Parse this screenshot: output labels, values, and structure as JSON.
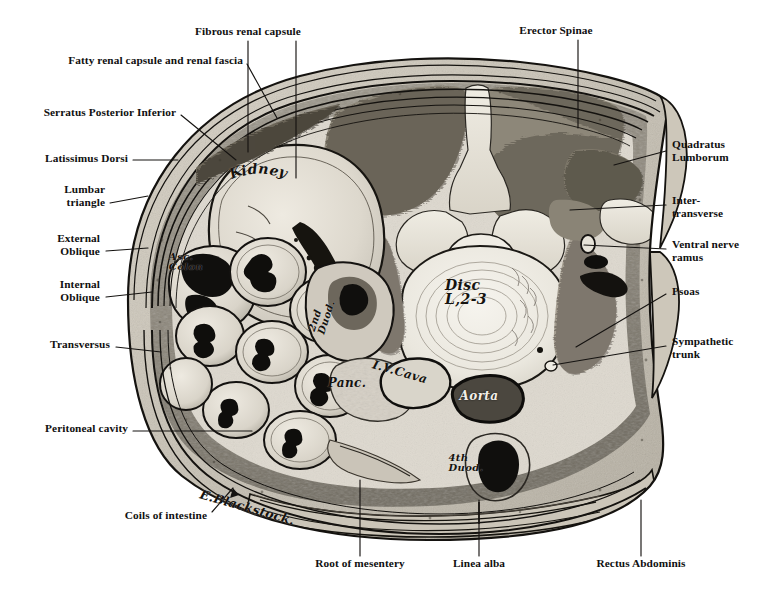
{
  "figure": {
    "kind": "anatomical-illustration",
    "signature": "E.Blackstock.",
    "palette": {
      "page_background": "#ffffff",
      "ink": "#101010",
      "leader_line": "#1a1a1a",
      "skin_fat": "#cfc9bd",
      "muscle_mid": "#9b958a",
      "muscle_dark": "#6f6a60",
      "viscera_light": "#ded9cf",
      "lumen_dark": "#141312",
      "bone_light": "#e8e4da",
      "disc_pale": "#efece4",
      "aorta_fill": "#4a463f",
      "cava_fill": "#d8d4ca"
    }
  },
  "printed_labels": [
    {
      "id": "fibrous-renal-capsule",
      "text": "Fibrous renal capsule",
      "side": "top",
      "align": "center",
      "x": 248,
      "y": 31
    },
    {
      "id": "erector-spinae",
      "text": "Erector Spinae",
      "side": "top",
      "align": "center",
      "x": 556,
      "y": 30
    },
    {
      "id": "fatty-renal-capsule",
      "text": "Fatty renal capsule and renal fascia",
      "side": "top",
      "align": "right",
      "x": 243,
      "y": 60
    },
    {
      "id": "serratus-post-inf",
      "text": "Serratus Posterior Inferior",
      "side": "left",
      "align": "right",
      "x": 176,
      "y": 112
    },
    {
      "id": "latissimus-dorsi",
      "text": "Latissimus Dorsi",
      "side": "left",
      "align": "right",
      "x": 128,
      "y": 158
    },
    {
      "id": "lumbar-triangle",
      "text": "Lumbar\ntriangle",
      "side": "left",
      "align": "right",
      "x": 105,
      "y": 189
    },
    {
      "id": "external-oblique",
      "text": "External\nOblique",
      "side": "left",
      "align": "right",
      "x": 100,
      "y": 238
    },
    {
      "id": "internal-oblique",
      "text": "Internal\nOblique",
      "side": "left",
      "align": "right",
      "x": 100,
      "y": 284
    },
    {
      "id": "transversus",
      "text": "Transversus",
      "side": "left",
      "align": "right",
      "x": 110,
      "y": 344
    },
    {
      "id": "peritoneal-cavity",
      "text": "Peritoneal cavity",
      "side": "left",
      "align": "right",
      "x": 128,
      "y": 428
    },
    {
      "id": "coils-of-intestine",
      "text": "Coils of intestine",
      "side": "left",
      "align": "right",
      "x": 207,
      "y": 515
    },
    {
      "id": "quadratus-lumborum",
      "text": "Quadratus\nLumborum",
      "side": "right",
      "align": "left",
      "x": 672,
      "y": 144
    },
    {
      "id": "inter-transverse",
      "text": "Inter-\ntransverse",
      "side": "right",
      "align": "left",
      "x": 672,
      "y": 200
    },
    {
      "id": "ventral-nerve-ramus",
      "text": "Ventral nerve\nramus",
      "side": "right",
      "align": "left",
      "x": 672,
      "y": 244
    },
    {
      "id": "psoas",
      "text": "Psoas",
      "side": "right",
      "align": "left",
      "x": 672,
      "y": 291
    },
    {
      "id": "sympathetic-trunk",
      "text": "Sympathetic\ntrunk",
      "side": "right",
      "align": "left",
      "x": 672,
      "y": 341
    },
    {
      "id": "root-of-mesentery",
      "text": "Root of mesentery",
      "side": "bottom",
      "align": "center",
      "x": 360,
      "y": 563
    },
    {
      "id": "linea-alba",
      "text": "Linea alba",
      "side": "bottom",
      "align": "center",
      "x": 479,
      "y": 563
    },
    {
      "id": "rectus-abdominis",
      "text": "Rectus Abdominis",
      "side": "bottom",
      "align": "center",
      "x": 641,
      "y": 563
    }
  ],
  "handwritten_labels": [
    {
      "id": "kidney",
      "text": "Kidney",
      "x": 258,
      "y": 168,
      "size": "lg",
      "arc": true,
      "on_dark": false
    },
    {
      "id": "asc-colon",
      "text": "Asc.\nColon",
      "x": 186,
      "y": 262,
      "size": "sm",
      "arc": false,
      "on_dark": false
    },
    {
      "id": "2nd-duod",
      "text": "2nd\nDuod.",
      "x": 322,
      "y": 316,
      "size": "sm",
      "arc": false,
      "on_dark": false,
      "rotate": -72
    },
    {
      "id": "panc",
      "text": "Panc.",
      "x": 347,
      "y": 383,
      "size": "md",
      "arc": false,
      "on_dark": false
    },
    {
      "id": "iv-cava",
      "text": "I.V.Cava",
      "x": 400,
      "y": 372,
      "size": "md",
      "arc": false,
      "on_dark": false,
      "rotate": 16
    },
    {
      "id": "disc-l2-3",
      "text": "Disc\nL,2-3",
      "x": 466,
      "y": 292,
      "size": "lg",
      "arc": false,
      "on_dark": false
    },
    {
      "id": "aorta",
      "text": "Aorta",
      "x": 479,
      "y": 396,
      "size": "md",
      "arc": false,
      "on_dark": true
    },
    {
      "id": "4th-duod",
      "text": "4th\nDuod.",
      "x": 466,
      "y": 463,
      "size": "sm",
      "arc": false,
      "on_dark": false
    },
    {
      "id": "signature",
      "text": "E.Blackstock.",
      "x": 247,
      "y": 508,
      "size": "sig",
      "arc": false,
      "on_dark": false,
      "rotate": 16
    }
  ],
  "leader_lines": [
    {
      "id": "leader-fibrous-renal-capsule-a",
      "points": "248,41 248,152"
    },
    {
      "id": "leader-fibrous-renal-capsule-b",
      "points": "296,41 296,178"
    },
    {
      "id": "leader-fatty-renal-capsule",
      "points": "247,64 277,118"
    },
    {
      "id": "leader-erector-spinae",
      "points": "578,40 578,128"
    },
    {
      "id": "leader-serratus",
      "points": "181,115 236,160"
    },
    {
      "id": "leader-latissimus",
      "points": "133,160 178,160"
    },
    {
      "id": "leader-lumbar-triangle",
      "points": "110,203 148,196"
    },
    {
      "id": "leader-external-oblique",
      "points": "106,251 148,248"
    },
    {
      "id": "leader-internal-oblique",
      "points": "106,297 152,292"
    },
    {
      "id": "leader-transversus",
      "points": "116,347 161,352"
    },
    {
      "id": "leader-peritoneal-cavity",
      "points": "133,431 252,431"
    },
    {
      "id": "leader-coils-of-intestine",
      "points": "212,512 233,488"
    },
    {
      "id": "leader-quadratus",
      "points": "666,151 614,165"
    },
    {
      "id": "leader-inter-transverse",
      "points": "666,205 570,210"
    },
    {
      "id": "leader-ventral-nerve-ramus",
      "points": "666,249 584,245"
    },
    {
      "id": "leader-psoas",
      "points": "666,294 576,347"
    },
    {
      "id": "leader-sympathetic-trunk",
      "points": "666,346 553,365"
    },
    {
      "id": "leader-root-of-mesentery",
      "points": "360,556 360,480"
    },
    {
      "id": "leader-linea-alba",
      "points": "479,556 479,500"
    },
    {
      "id": "leader-rectus-abdominis",
      "points": "641,556 641,500"
    }
  ],
  "anatomy_regions": [
    {
      "id": "skin-and-superficial-fascia",
      "label": "Skin and superficial fascia"
    },
    {
      "id": "latissimus-dorsi-muscle",
      "label": "Latissimus Dorsi"
    },
    {
      "id": "serratus-posterior-inferior",
      "label": "Serratus Posterior Inferior"
    },
    {
      "id": "external-oblique-muscle",
      "label": "External Oblique"
    },
    {
      "id": "internal-oblique-muscle",
      "label": "Internal Oblique"
    },
    {
      "id": "transversus-abdominis",
      "label": "Transversus"
    },
    {
      "id": "erector-spinae-muscle",
      "label": "Erector Spinae"
    },
    {
      "id": "quadratus-lumborum-muscle",
      "label": "Quadratus Lumborum"
    },
    {
      "id": "psoas-major-muscle",
      "label": "Psoas"
    },
    {
      "id": "right-kidney",
      "label": "Kidney"
    },
    {
      "id": "ascending-colon",
      "label": "Asc. Colon"
    },
    {
      "id": "jejunal-coils",
      "label": "Coils of intestine"
    },
    {
      "id": "second-part-duodenum",
      "label": "2nd Duod."
    },
    {
      "id": "fourth-part-duodenum",
      "label": "4th Duod."
    },
    {
      "id": "pancreas",
      "label": "Panc."
    },
    {
      "id": "inferior-vena-cava",
      "label": "I.V.Cava"
    },
    {
      "id": "aorta-vessel",
      "label": "Aorta"
    },
    {
      "id": "intervertebral-disc",
      "label": "Disc L,2-3"
    },
    {
      "id": "vertebral-arch-and-canal",
      "label": "Vertebral canal"
    },
    {
      "id": "rectus-abdominis-muscle",
      "label": "Rectus Abdominis"
    },
    {
      "id": "linea-alba-raphe",
      "label": "Linea alba"
    },
    {
      "id": "root-of-mesentery-region",
      "label": "Root of mesentery"
    },
    {
      "id": "sympathetic-trunk-node",
      "label": "Sympathetic trunk"
    },
    {
      "id": "intertransverse-muscle",
      "label": "Inter-transverse"
    },
    {
      "id": "ventral-nerve-ramus-nerve",
      "label": "Ventral nerve ramus"
    }
  ]
}
